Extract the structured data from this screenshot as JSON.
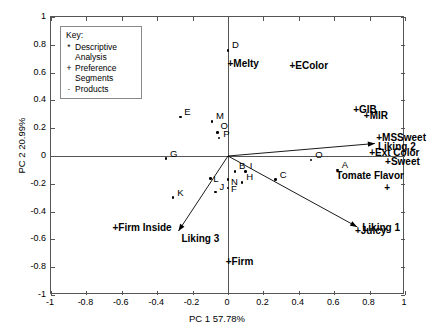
{
  "chart_data": {
    "type": "scatter",
    "title": "",
    "xlabel": "PC 1 57.78%",
    "ylabel": "PC 2 20.99%",
    "xlim": [
      -1,
      1
    ],
    "ylim": [
      -1,
      1
    ],
    "xticks": [
      "-1",
      "-0.8",
      "-0.6",
      "-0.4",
      "-0.2",
      "0",
      "0.2",
      "0.4",
      "0.6",
      "0.8",
      "1"
    ],
    "ytickvals": [
      -1,
      -0.8,
      -0.6,
      -0.4,
      -0.2,
      0,
      0.2,
      0.4,
      0.6,
      0.8,
      1
    ],
    "xtickvals": [
      -1,
      -0.8,
      -0.6,
      -0.4,
      -0.2,
      0,
      0.2,
      0.4,
      0.6,
      0.8,
      1
    ],
    "yticks": [
      "-1",
      "-0.8",
      "-0.6",
      "-0.4",
      "-0.2",
      "0",
      "0.2",
      "0.4",
      "0.6",
      "0.8",
      "1"
    ],
    "grid": false,
    "legend_position": "top-left",
    "series": [
      {
        "name": "Products",
        "symbol": "dot",
        "points": [
          {
            "label": "D",
            "x": 0.0,
            "y": 0.76
          },
          {
            "label": "E",
            "x": -0.27,
            "y": 0.28
          },
          {
            "label": "M",
            "x": -0.09,
            "y": 0.25
          },
          {
            "label": "O",
            "x": -0.06,
            "y": 0.17
          },
          {
            "label": "P",
            "x": -0.05,
            "y": 0.13
          },
          {
            "label": "G",
            "x": -0.35,
            "y": -0.02
          },
          {
            "label": "O2",
            "x": 0.47,
            "y": -0.03
          },
          {
            "label": "A",
            "x": 0.62,
            "y": -0.1
          },
          {
            "label": "B",
            "x": 0.04,
            "y": -0.11
          },
          {
            "label": "I",
            "x": 0.1,
            "y": -0.11
          },
          {
            "label": "N",
            "x": 0.0,
            "y": -0.17
          },
          {
            "label": "H",
            "x": 0.08,
            "y": -0.19
          },
          {
            "label": "C",
            "x": 0.27,
            "y": -0.17
          },
          {
            "label": "L",
            "x": -0.1,
            "y": -0.16
          },
          {
            "label": "F",
            "x": 0.0,
            "y": -0.23
          },
          {
            "label": "J",
            "x": -0.07,
            "y": -0.26
          },
          {
            "label": "K",
            "x": -0.31,
            "y": -0.3
          }
        ]
      },
      {
        "name": "Descriptive Analysis",
        "symbol": "plus",
        "points": [
          {
            "label": "Melty",
            "x": 0.02,
            "y": 0.66
          },
          {
            "label": "EColor",
            "x": 0.37,
            "y": 0.65
          },
          {
            "label": "GIB",
            "x": 0.73,
            "y": 0.33
          },
          {
            "label": "MIR",
            "x": 0.79,
            "y": 0.29
          },
          {
            "label": "MSSweet",
            "x": 0.86,
            "y": 0.13
          },
          {
            "label": "Ext Color",
            "x": 0.82,
            "y": 0.02
          },
          {
            "label": "Sweet",
            "x": 0.91,
            "y": -0.04
          },
          {
            "label": "Tomate Flavor",
            "x": 0.9,
            "y": -0.22
          },
          {
            "label": "Juicy",
            "x": 0.74,
            "y": -0.54
          },
          {
            "label": "Firm",
            "x": 0.01,
            "y": -0.76
          },
          {
            "label": "Firm Inside",
            "x": -0.63,
            "y": -0.52
          }
        ]
      },
      {
        "name": "Preference Segments",
        "symbol": "arrow",
        "vectors": [
          {
            "label": "Liking 2",
            "x": 0.83,
            "y": 0.09
          },
          {
            "label": "Liking 1",
            "x": 0.73,
            "y": -0.51
          },
          {
            "label": "Liking 3",
            "x": -0.28,
            "y": -0.54
          }
        ]
      }
    ]
  },
  "legend": {
    "title": "Key:",
    "entries": [
      {
        "symbol": "*",
        "line1": "Descriptive",
        "line2": "Analysis"
      },
      {
        "symbol": "+",
        "line1": "Preference",
        "line2": "Segments"
      },
      {
        "symbol": "·",
        "line1": "Products",
        "line2": ""
      }
    ]
  },
  "axes": {
    "x_title": "PC 1 57.78%",
    "y_title": "PC 2 20.99%"
  }
}
